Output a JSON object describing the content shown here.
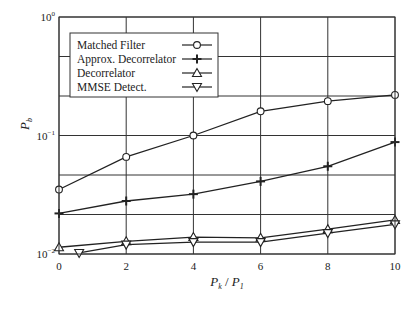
{
  "chart_data": {
    "type": "line",
    "title": "",
    "xlabel": "P_k / P_1",
    "xlabel_parts": {
      "p1": "P",
      "s1": "k",
      "sep": " / ",
      "p2": "P",
      "s2": "1"
    },
    "ylabel": "P_b",
    "ylabel_parts": {
      "p": "P",
      "s": "b"
    },
    "x_scale": "linear",
    "y_scale": "log",
    "xlim": [
      0,
      10
    ],
    "ylim": [
      0.01,
      1
    ],
    "x_ticks": [
      0,
      2,
      4,
      6,
      8,
      10
    ],
    "y_ticks": [
      {
        "value": 1,
        "base": "10",
        "exp": "0"
      },
      {
        "value": 0.1,
        "base": "10",
        "exp": "−1"
      },
      {
        "value": 0.01,
        "base": "10",
        "exp": "−2"
      }
    ],
    "y_grid_per_decade": 3,
    "grid": true,
    "legend": {
      "position": "top-left"
    },
    "series": [
      {
        "name": "Matched Filter",
        "marker": "circle",
        "x": [
          0,
          2,
          4,
          6,
          8,
          10
        ],
        "y": [
          0.035,
          0.066,
          0.1,
          0.16,
          0.195,
          0.22
        ]
      },
      {
        "name": "Approx. Decorrelator",
        "marker": "plus",
        "x": [
          0,
          2,
          4,
          6,
          8,
          10
        ],
        "y": [
          0.022,
          0.028,
          0.032,
          0.041,
          0.055,
          0.088
        ]
      },
      {
        "name": "Decorrelator",
        "marker": "triangle-up",
        "x": [
          0,
          2,
          4,
          6,
          8,
          10
        ],
        "y": [
          0.0114,
          0.0128,
          0.0139,
          0.0137,
          0.0162,
          0.0194
        ]
      },
      {
        "name": "MMSE Detect.",
        "marker": "triangle-down",
        "x": [
          0.6,
          2,
          4,
          6,
          8,
          10
        ],
        "y": [
          0.0102,
          0.012,
          0.0126,
          0.0126,
          0.015,
          0.0178
        ]
      }
    ]
  }
}
